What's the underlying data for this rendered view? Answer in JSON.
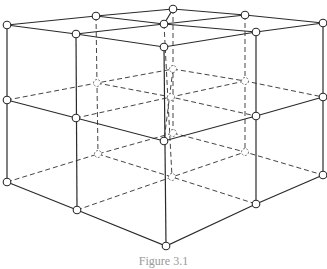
{
  "figure": {
    "type": "3D cubic lattice (2x2x2 cells) with visible solid edges and hidden dashed edges",
    "caption": "Figure 3.1",
    "colors": {
      "line": "#2a2a2a",
      "hidden_line": "#444444",
      "background": "#ffffff"
    },
    "nodes_visible": [
      {
        "x": 7,
        "y": 25
      },
      {
        "x": 96,
        "y": 16
      },
      {
        "x": 173,
        "y": 9
      },
      {
        "x": 245,
        "y": 15
      },
      {
        "x": 323,
        "y": 23
      },
      {
        "x": 164,
        "y": 24
      },
      {
        "x": 76,
        "y": 34
      },
      {
        "x": 164,
        "y": 47
      },
      {
        "x": 256,
        "y": 32
      },
      {
        "x": 7,
        "y": 100
      },
      {
        "x": 76,
        "y": 118
      },
      {
        "x": 164,
        "y": 141
      },
      {
        "x": 256,
        "y": 116
      },
      {
        "x": 323,
        "y": 97
      },
      {
        "x": 7,
        "y": 182
      },
      {
        "x": 77,
        "y": 210
      },
      {
        "x": 166,
        "y": 246
      },
      {
        "x": 256,
        "y": 204
      },
      {
        "x": 323,
        "y": 175
      }
    ],
    "nodes_hidden": [
      {
        "x": 97,
        "y": 83
      },
      {
        "x": 173,
        "y": 69
      },
      {
        "x": 245,
        "y": 81
      },
      {
        "x": 171,
        "y": 97
      },
      {
        "x": 98,
        "y": 154
      },
      {
        "x": 173,
        "y": 133
      },
      {
        "x": 245,
        "y": 152
      },
      {
        "x": 172,
        "y": 177
      }
    ]
  }
}
